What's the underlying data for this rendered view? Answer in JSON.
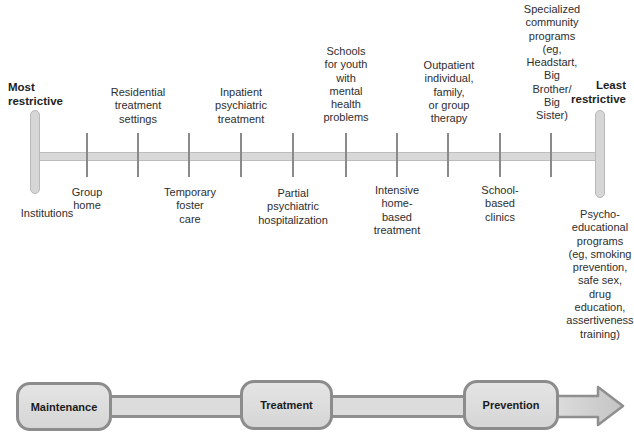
{
  "continuum": {
    "left_end": {
      "line1": "Most",
      "line2": "restrictive"
    },
    "right_end": {
      "line1": "Least",
      "line2": "restrictive"
    },
    "bar_color": "#d8d8d8",
    "tick_color": "#8a8a8a",
    "items": [
      {
        "lines": [
          "Institutions"
        ]
      },
      {
        "lines": [
          "Group",
          "home"
        ]
      },
      {
        "lines": [
          "Residential",
          "treatment",
          "settings"
        ]
      },
      {
        "lines": [
          "Temporary",
          "foster",
          "care"
        ]
      },
      {
        "lines": [
          "Inpatient",
          "psychiatric",
          "treatment"
        ]
      },
      {
        "lines": [
          "Partial",
          "psychiatric",
          "hospitalization"
        ]
      },
      {
        "lines": [
          "Schools",
          "for youth",
          "with",
          "mental",
          "health",
          "problems"
        ]
      },
      {
        "lines": [
          "Intensive",
          "home-",
          "based",
          "treatment"
        ]
      },
      {
        "lines": [
          "Outpatient",
          "individual,",
          "family,",
          "or group",
          "therapy"
        ]
      },
      {
        "lines": [
          "School-",
          "based",
          "clinics"
        ]
      },
      {
        "lines": [
          "Specialized",
          "community",
          "programs",
          "(eg,",
          "Headstart,",
          "Big",
          "Brother/",
          "Big",
          "Sister)"
        ]
      },
      {
        "lines": [
          "Psycho-",
          "educational",
          "programs",
          "(eg, smoking",
          "prevention,",
          "safe sex,",
          "drug",
          "education,",
          "assertiveness",
          "training)"
        ]
      }
    ]
  },
  "stages": {
    "maintenance": "Maintenance",
    "treatment": "Treatment",
    "prevention": "Prevention",
    "box_border": "#8c8c8c",
    "box_fill": "#dedede"
  }
}
